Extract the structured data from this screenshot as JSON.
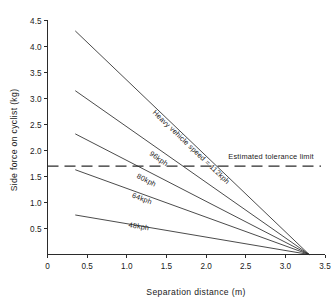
{
  "chart_data": {
    "type": "line",
    "title": "",
    "xlabel": "Separation distance (m)",
    "ylabel": "Side force on cyclist (kg)",
    "xlim": [
      0,
      3.5
    ],
    "ylim": [
      0,
      4.5
    ],
    "grid": false,
    "legend_position": "inline-labels",
    "x_ticks": [
      "0",
      "0.5",
      "1.0",
      "1.5",
      "2.0",
      "2.5",
      "3.0",
      "3.5"
    ],
    "x_tick_values": [
      0,
      0.5,
      1.0,
      1.5,
      2.0,
      2.5,
      3.0,
      3.5
    ],
    "y_ticks": [
      "0.5",
      "1.0",
      "1.5",
      "2.0",
      "2.5",
      "3.0",
      "3.5",
      "4.0",
      "4.5"
    ],
    "y_tick_values": [
      0.5,
      1.0,
      1.5,
      2.0,
      2.5,
      3.0,
      3.5,
      4.0,
      4.5
    ],
    "convergence_point": [
      3.3,
      0
    ],
    "series": [
      {
        "name": "Heavy vehicle speed = 112kph",
        "label": "Heavy vehicle speed = 112kph",
        "x": [
          0.35,
          3.3
        ],
        "values": [
          4.3,
          0
        ],
        "label_x": 1.32,
        "label_y": 2.72
      },
      {
        "name": "96kph",
        "label": "96kph",
        "x": [
          0.35,
          3.3
        ],
        "values": [
          3.15,
          0
        ],
        "label_x": 1.28,
        "label_y": 1.92
      },
      {
        "name": "80kph",
        "label": "80kph",
        "x": [
          0.35,
          3.3
        ],
        "values": [
          2.32,
          0
        ],
        "label_x": 1.12,
        "label_y": 1.48
      },
      {
        "name": "64kph",
        "label": "64kph",
        "x": [
          0.35,
          3.3
        ],
        "values": [
          1.63,
          0
        ],
        "label_x": 1.06,
        "label_y": 1.1
      },
      {
        "name": "48kph",
        "label": "48kph",
        "x": [
          0.35,
          3.3
        ],
        "values": [
          0.76,
          0
        ],
        "label_x": 1.02,
        "label_y": 0.53
      }
    ],
    "annotations": [
      {
        "name": "estimated-tolerance-limit",
        "text": "Estimated tolerance limit",
        "type": "horizontal-dashed-line",
        "y_value": 1.7,
        "x_start": 0.0,
        "x_end": 3.45,
        "label_x": 2.28,
        "label_y": 1.84
      }
    ],
    "colors": {
      "line": "#2b2b2b",
      "axis": "#2b2b2b",
      "text": "#1a1a1a",
      "background": "#ffffff"
    }
  }
}
